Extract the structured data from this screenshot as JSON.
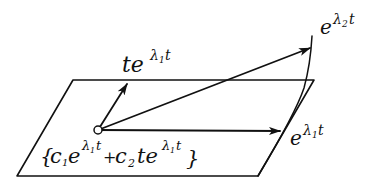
{
  "diagram": {
    "type": "vector-plane-diagram",
    "plane": {
      "corners": [
        [
          73,
          80
        ],
        [
          314,
          80
        ],
        [
          258,
          176
        ],
        [
          17,
          176
        ]
      ]
    },
    "origin": [
      98,
      130
    ],
    "vectors": [
      {
        "name": "t-e-lambda1-t",
        "tip": [
          128,
          82
        ]
      },
      {
        "name": "e-lambda2-t",
        "tip": [
          312,
          47
        ]
      },
      {
        "name": "e-lambda1-t",
        "tip": [
          281,
          131
        ]
      }
    ],
    "curve": {
      "points": [
        [
          258,
          176
        ],
        [
          290,
          120
        ],
        [
          306,
          86
        ],
        [
          312,
          38
        ]
      ]
    }
  },
  "labels": {
    "te_l1t": {
      "base": "te",
      "exp": "λ",
      "sub": "1",
      "tail": "t"
    },
    "e_l2t": {
      "base": "e",
      "exp": "λ",
      "sub": "2",
      "tail": "t"
    },
    "e_l1t": {
      "base": "e",
      "exp": "λ",
      "sub": "1",
      "tail": "t"
    },
    "span": {
      "open": "{",
      "c1": "c",
      "c1_sub": "1",
      "e1": "e",
      "e1_exp": "λ",
      "e1_exp_sub": "1",
      "e1_exp_tail": "t",
      "plus": "+",
      "c2": "c",
      "c2_sub": "2",
      "t2": "te",
      "e2_exp": "λ",
      "e2_exp_sub": "1",
      "e2_exp_tail": "t",
      "close": "}"
    }
  }
}
